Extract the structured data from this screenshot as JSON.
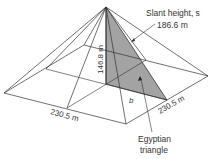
{
  "diagram": {
    "labels": {
      "slant_title": "Slant height, s",
      "slant_value": "186.6 m",
      "height": "146.8 m",
      "base_left": "230.5 m",
      "base_right": "230.5 m",
      "half_base": "b",
      "triangle_line1": "Egyptian",
      "triangle_line2": "triangle"
    },
    "colors": {
      "lines": "#333333",
      "shaded_triangle": "#a0a0a0",
      "text": "#333333"
    }
  }
}
